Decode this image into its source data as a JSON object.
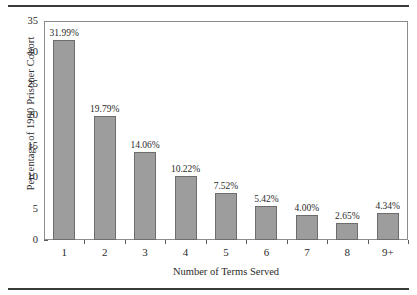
{
  "chart_data": {
    "type": "bar",
    "title": "",
    "xlabel": "Number of Terms Served",
    "ylabel": "Percentage of 1990 Prisoner Cohort",
    "categories": [
      "1",
      "2",
      "3",
      "4",
      "5",
      "6",
      "7",
      "8",
      "9+"
    ],
    "values": [
      31.99,
      19.79,
      14.06,
      10.22,
      7.52,
      5.42,
      4.0,
      2.65,
      4.34
    ],
    "data_labels": [
      "31.99%",
      "19.79%",
      "14.06%",
      "10.22%",
      "7.52%",
      "5.42%",
      "4.00%",
      "2.65%",
      "4.34%"
    ],
    "ylim": [
      0,
      35
    ],
    "yticks": [
      0,
      5,
      10,
      15,
      20,
      25,
      30,
      35
    ],
    "ytick_labels": [
      "0",
      "5",
      "10",
      "15",
      "20",
      "25",
      "30",
      "35"
    ],
    "grid": false,
    "legend": false,
    "bar_color": "#9d9d9d",
    "bar_edge_color": "#6d6d6d",
    "axis_color": "#8c8c8c",
    "text_color": "#2b2b2b",
    "background": "#ffffff"
  },
  "figure": {
    "top_rule": "",
    "bottom_rule": ""
  }
}
